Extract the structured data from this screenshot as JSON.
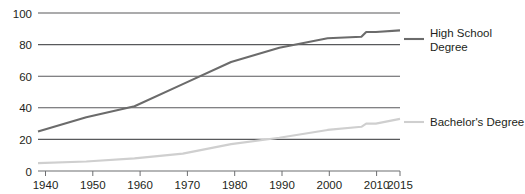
{
  "chart_data": {
    "type": "line",
    "title": "",
    "subtitle": "",
    "xlabel": "",
    "ylabel": "",
    "xlim": [
      1940,
      2015
    ],
    "ylim": [
      0,
      100
    ],
    "grid": true,
    "legend_position": "right",
    "y_ticks": [
      "0",
      "20",
      "40",
      "60",
      "80",
      "100"
    ],
    "y_tick_values": [
      0,
      20,
      40,
      60,
      80,
      100
    ],
    "x_ticks": [
      "1940",
      "1950",
      "1960",
      "1970",
      "1980",
      "1990",
      "2000",
      "2010",
      "2015"
    ],
    "x_tick_values": [
      1940,
      1950,
      1960,
      1970,
      1980,
      1990,
      2000,
      2010,
      2015
    ],
    "series": [
      {
        "name": "High School Degree",
        "color": "#6b6b6b",
        "x": [
          1940,
          1950,
          1960,
          1970,
          1980,
          1990,
          2000,
          2007,
          2008,
          2010,
          2015
        ],
        "values": [
          25,
          34,
          41,
          55,
          69,
          78,
          84,
          85,
          88,
          88,
          89
        ]
      },
      {
        "name": "Bachelor's Degree",
        "color": "#cfcfcf",
        "x": [
          1940,
          1950,
          1960,
          1970,
          1980,
          1990,
          2000,
          2007,
          2008,
          2010,
          2015
        ],
        "values": [
          5,
          6,
          8,
          11,
          17,
          21,
          26,
          28,
          30,
          30,
          33
        ]
      }
    ]
  },
  "legend": {
    "high_school": {
      "line1": "High School",
      "line2": "Degree"
    },
    "bachelors": {
      "line1": "Bachelor's Degree"
    }
  },
  "colors": {
    "high_school_line": "#6b6b6b",
    "bachelors_line": "#cfcfcf",
    "gridline": "#58595b",
    "axis": "#6d6e71",
    "text": "#231f20",
    "background": "#ffffff"
  }
}
